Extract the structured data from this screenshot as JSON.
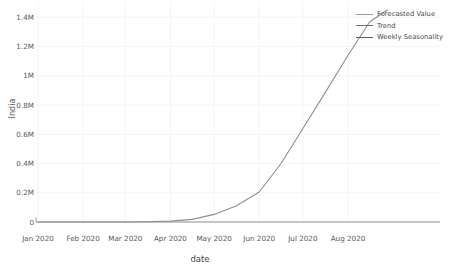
{
  "chart_data": {
    "type": "line",
    "title": "",
    "xlabel": "date",
    "ylabel": "India",
    "grid": true,
    "legend_position": "top-right",
    "xlim": [
      "Jan 2020",
      "Aug 2020"
    ],
    "ylim": [
      0,
      1450000
    ],
    "y_ticks": [
      {
        "label": "0",
        "value": 0
      },
      {
        "label": "0.2M",
        "value": 200000
      },
      {
        "label": "0.4M",
        "value": 400000
      },
      {
        "label": "0.6M",
        "value": 600000
      },
      {
        "label": "0.8M",
        "value": 800000
      },
      {
        "label": "1M",
        "value": 1000000
      },
      {
        "label": "1.2M",
        "value": 1200000
      },
      {
        "label": "1.4M",
        "value": 1400000
      }
    ],
    "x_ticks": [
      {
        "label": "Jan 2020",
        "value": 0
      },
      {
        "label": "Feb 2020",
        "value": 31
      },
      {
        "label": "Mar 2020",
        "value": 60
      },
      {
        "label": "Apr 2020",
        "value": 91
      },
      {
        "label": "May 2020",
        "value": 121
      },
      {
        "label": "Jun 2020",
        "value": 152
      },
      {
        "label": "Jul 2020",
        "value": 182
      },
      {
        "label": "Aug 2020",
        "value": 213
      }
    ],
    "legend": [
      {
        "name": "Forecasted Value",
        "color": "#9a9a9a"
      },
      {
        "name": "Trend",
        "color": "#6f6f6f"
      },
      {
        "name": "Weekly Seasonality",
        "color": "#5a5a5a"
      }
    ],
    "series": [
      {
        "name": "Forecasted Value",
        "color": "#8e8e8e",
        "x": [
          0,
          15,
          31,
          46,
          60,
          75,
          91,
          106,
          121,
          136,
          152,
          167,
          182,
          197,
          213,
          228,
          240
        ],
        "values": [
          0,
          0,
          0,
          0,
          500,
          2000,
          6000,
          18000,
          52000,
          110000,
          205000,
          400000,
          640000,
          880000,
          1140000,
          1370000,
          1450000
        ]
      }
    ],
    "annotations": []
  },
  "axes": {
    "y_title": "India",
    "x_title": "date"
  }
}
